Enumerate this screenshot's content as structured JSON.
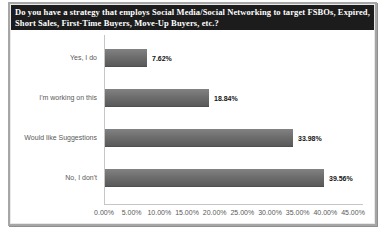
{
  "chart_data": {
    "type": "bar",
    "orientation": "horizontal",
    "title": "Do you have a strategy that employs Social Media/Social Networking to target FSBOs, Expired, Short Sales, First-Time Buyers, Move-Up Buyers, etc.?",
    "categories": [
      "Yes, I do",
      "I'm working on this",
      "Would like Suggestions",
      "No, I don't"
    ],
    "values": [
      7.62,
      18.84,
      33.98,
      39.56
    ],
    "value_labels": [
      "7.62%",
      "18.84%",
      "33.98%",
      "39.56%"
    ],
    "x_ticks": [
      "0.00%",
      "5.00%",
      "10.00%",
      "15.00%",
      "20.00%",
      "25.00%",
      "30.00%",
      "35.00%",
      "40.00%",
      "45.00%"
    ],
    "xlim": [
      0,
      45
    ],
    "gridlines": false,
    "legend": "none",
    "colors": {
      "bar": "#6e6e6e",
      "title_background": "#1c1c1c",
      "title_text": "#ffffff",
      "category_text": "#595959",
      "value_text": "#141414",
      "axis_line": "#c6c6c6",
      "frame_border": "#a6a6a6"
    }
  }
}
